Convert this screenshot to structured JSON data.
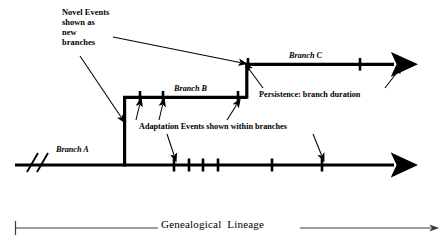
{
  "figure": {
    "title_axis": "Genealogical  Lineage",
    "labels": {
      "novel_events": "Novel Events\nshown as\nnew\nbranches",
      "branch_a": "Branch A",
      "branch_b": "Branch B",
      "branch_c": "Branch C",
      "persistence": "Persistence: branch duration",
      "adaptation": "Adaptation Events shown within branches"
    },
    "colors": {
      "ink": "#000000",
      "background": "#ffffff",
      "axis": "#3b3b3b"
    }
  },
  "diagram_data": {
    "type": "diagram",
    "description": "Genealogical lineage diagram with three branches and event tick marks",
    "branches": [
      {
        "name": "Branch A",
        "y": 165,
        "x_start": 15,
        "x_end": 400,
        "arrow_end": true,
        "break_marks": [
          30,
          40
        ],
        "event_ticks": [
          174,
          189,
          203,
          218,
          272,
          322
        ]
      },
      {
        "name": "Branch B",
        "y": 97,
        "x_start": 124,
        "x_end": 247,
        "arrow_end": false,
        "riser_from_y": 165,
        "event_ticks": [
          140,
          163,
          238
        ]
      },
      {
        "name": "Branch C",
        "y": 64,
        "x_start": 247,
        "x_end": 400,
        "arrow_end": true,
        "riser_from_y": 97,
        "event_ticks": [
          360
        ]
      }
    ],
    "annotation_arrows": [
      {
        "from": [
          113,
          37
        ],
        "to": [
          243,
          63
        ],
        "target": "branch-c-origin"
      },
      {
        "from": [
          80,
          57
        ],
        "to": [
          122,
          120
        ],
        "target": "branch-b-origin"
      },
      {
        "from": [
          137,
          119
        ],
        "to": [
          140,
          102
        ],
        "target": "branch-b-tick-1"
      },
      {
        "from": [
          160,
          119
        ],
        "to": [
          163,
          102
        ],
        "target": "branch-b-tick-2"
      },
      {
        "from": [
          228,
          119
        ],
        "to": [
          238,
          102
        ],
        "target": "branch-b-tick-3"
      },
      {
        "from": [
          175,
          135
        ],
        "to": [
          174,
          158
        ],
        "target": "branch-a-tick-1"
      },
      {
        "from": [
          315,
          135
        ],
        "to": [
          322,
          158
        ],
        "target": "branch-a-tick-6"
      },
      {
        "from": [
          262,
          88
        ],
        "to": [
          247,
          68
        ],
        "target": "branch-c-start"
      },
      {
        "from": [
          385,
          88
        ],
        "to": [
          399,
          70
        ],
        "target": "branch-c-arrowhead"
      }
    ],
    "axis": {
      "label": "Genealogical  Lineage",
      "y": 228,
      "x_start": 15,
      "x_end": 437,
      "start_cap": "tick",
      "end_cap": "arrow"
    }
  }
}
